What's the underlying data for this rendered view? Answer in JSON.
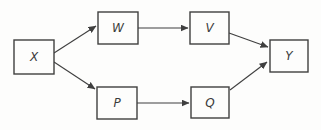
{
  "diagram": {
    "canvas": {
      "width": 321,
      "height": 130,
      "background": "#fdfdfc"
    },
    "style": {
      "stroke_color": "#3f3f3f",
      "node_fill": "#fdfdfc",
      "label_color": "#3a3a3a",
      "node_stroke_width": 1.4,
      "edge_stroke_width": 1.1
    },
    "nodes": [
      {
        "id": "X",
        "label": "X",
        "x": 14,
        "y": 40,
        "w": 40,
        "h": 34
      },
      {
        "id": "W",
        "label": "W",
        "x": 98,
        "y": 12,
        "w": 40,
        "h": 32
      },
      {
        "id": "V",
        "label": "V",
        "x": 190,
        "y": 12,
        "w": 39,
        "h": 32
      },
      {
        "id": "P",
        "label": "P",
        "x": 97,
        "y": 87,
        "w": 40,
        "h": 32
      },
      {
        "id": "Q",
        "label": "Q",
        "x": 191,
        "y": 87,
        "w": 38,
        "h": 31
      },
      {
        "id": "Y",
        "label": "Y",
        "x": 270,
        "y": 40,
        "w": 38,
        "h": 32
      }
    ],
    "edges": [
      {
        "from": "X",
        "to": "W",
        "x1": 54,
        "y1": 53,
        "x2": 96,
        "y2": 26
      },
      {
        "from": "X",
        "to": "P",
        "x1": 54,
        "y1": 62,
        "x2": 95,
        "y2": 89
      },
      {
        "from": "W",
        "to": "V",
        "x1": 138,
        "y1": 28,
        "x2": 188,
        "y2": 28
      },
      {
        "from": "P",
        "to": "Q",
        "x1": 137,
        "y1": 103,
        "x2": 189,
        "y2": 103
      },
      {
        "from": "V",
        "to": "Y",
        "x1": 229,
        "y1": 33,
        "x2": 268,
        "y2": 47
      },
      {
        "from": "Q",
        "to": "Y",
        "x1": 230,
        "y1": 90,
        "x2": 267,
        "y2": 62
      }
    ]
  }
}
